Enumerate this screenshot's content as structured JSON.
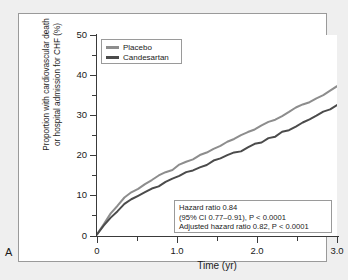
{
  "panel": {
    "letter": "A"
  },
  "chart_data": {
    "type": "line",
    "title": "",
    "xlabel": "Time (yr)",
    "ylabel": "Proportion with cardiovascular death or hospital admission for CHF (%)",
    "ylabel_line1": "Proportion with cardiovascular death",
    "ylabel_line2": "or hospital admission for CHF (%)",
    "xlim": [
      0,
      3.5
    ],
    "ylim": [
      0,
      50
    ],
    "x_ticks": [
      0,
      1.0,
      2.0,
      3.0
    ],
    "x_tick_labels": [
      "0",
      "1.0",
      "2.0",
      "3.0"
    ],
    "x_minor_ticks": [
      0.5,
      1.5,
      2.5,
      3.5
    ],
    "y_ticks": [
      0,
      10,
      20,
      30,
      40,
      50
    ],
    "y_tick_labels": [
      "0",
      "10",
      "20",
      "30",
      "40",
      "50"
    ],
    "y_minor_ticks": [
      5,
      15,
      25,
      35,
      45
    ],
    "grid": false,
    "legend_position": "top-left",
    "x": [
      0,
      0.1,
      0.2,
      0.3,
      0.4,
      0.5,
      0.6,
      0.7,
      0.8,
      0.9,
      1.0,
      1.1,
      1.2,
      1.3,
      1.4,
      1.5,
      1.6,
      1.7,
      1.8,
      1.9,
      2.0,
      2.1,
      2.2,
      2.3,
      2.4,
      2.5,
      2.6,
      2.7,
      2.8,
      2.9,
      3.0,
      3.1,
      3.2,
      3.3,
      3.4,
      3.5
    ],
    "series": [
      {
        "name": "Placebo",
        "color": "#8d8d8d",
        "values": [
          0.4,
          3.2,
          5.6,
          7.6,
          9.6,
          10.8,
          11.9,
          13.0,
          13.9,
          14.8,
          15.7,
          16.6,
          17.5,
          18.3,
          19.1,
          19.9,
          20.8,
          21.6,
          22.5,
          23.3,
          24.1,
          25.0,
          25.9,
          26.7,
          27.6,
          28.4,
          29.2,
          30.0,
          30.9,
          31.7,
          32.6,
          33.4,
          34.3,
          35.2,
          36.1,
          37.0
        ]
      },
      {
        "name": "Candesartan",
        "color": "#4b4b4b",
        "values": [
          0.4,
          2.6,
          4.6,
          6.3,
          7.8,
          9.0,
          10.0,
          10.9,
          11.8,
          12.6,
          13.4,
          14.2,
          15.0,
          15.7,
          16.4,
          17.1,
          17.8,
          18.5,
          19.2,
          19.9,
          20.6,
          21.3,
          22.0,
          22.7,
          23.4,
          24.2,
          24.9,
          25.7,
          26.5,
          27.3,
          28.2,
          29.1,
          30.0,
          30.9,
          31.7,
          32.5
        ]
      }
    ],
    "annotations": {
      "stats_box": {
        "lines": [
          "Hazard ratio 0.84",
          "(95% CI 0.77–0.91), P < 0.0001",
          "Adjusted hazard ratio 0.82, P < 0.0001"
        ],
        "hazard_ratio": 0.84,
        "ci_low": 0.77,
        "ci_high": 0.91,
        "p_value": "< 0.0001",
        "adjusted_hazard_ratio": 0.82,
        "adjusted_p_value": "< 0.0001"
      }
    }
  },
  "legend": {
    "entries": [
      {
        "label": "Placebo",
        "color": "#8d8d8d"
      },
      {
        "label": "Candesartan",
        "color": "#4b4b4b"
      }
    ]
  },
  "colors": {
    "placebo": "#8d8d8d",
    "candesartan": "#4b4b4b",
    "axis": "#3a3a3a",
    "frame": "#9a9a9a",
    "page_background": "#efefef",
    "plot_background": "#ffffff"
  }
}
